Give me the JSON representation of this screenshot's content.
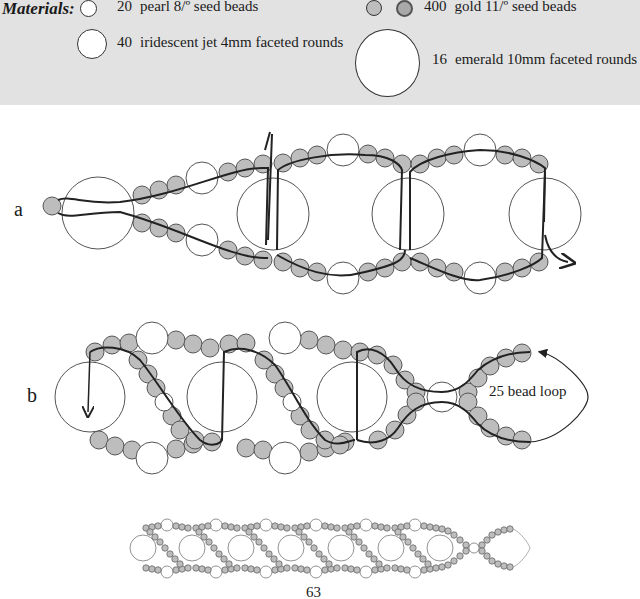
{
  "materials": {
    "title": "Materials:",
    "items": [
      {
        "qty": "20",
        "desc": "pearl 8/º seed beads",
        "swatch": "small-white-circle"
      },
      {
        "qty": "40",
        "desc": "iridescent jet 4mm faceted rounds",
        "swatch": "medium-white-circle"
      },
      {
        "qty": "400",
        "desc": "gold 11/º seed beads",
        "swatch": "gray-circles"
      },
      {
        "qty": "16",
        "desc": "emerald 10mm faceted rounds",
        "swatch": "large-white-circle"
      }
    ]
  },
  "diagrams": {
    "a": {
      "label": "a"
    },
    "b": {
      "label": "b",
      "annotation": "25 bead loop"
    }
  },
  "colors": {
    "band": "#e2e2e2",
    "seed_bead_fill": "#bdbdbd",
    "bead_outline": "#555555",
    "thread": "#222222"
  },
  "page": {
    "number": "63"
  }
}
